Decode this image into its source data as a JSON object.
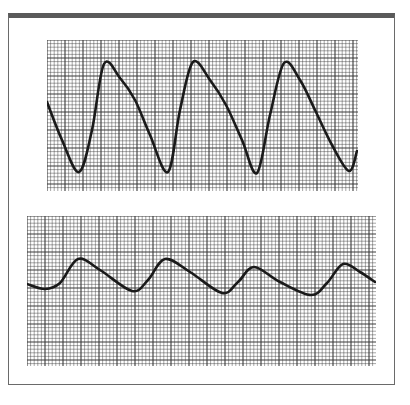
{
  "figure": {
    "grid": {
      "major_spacing_px": 18,
      "minor_per_major": 5,
      "line_color": "#3a3a3a",
      "trace_color": "#1a1a1a"
    }
  },
  "chart_data": [
    {
      "type": "line",
      "title": "",
      "panel": "top",
      "description": "Large-amplitude periodic waveform with sharp upstroke, rounded peak, shoulder and gradual downstroke",
      "x": [
        47,
        62,
        79,
        92,
        104,
        120,
        135,
        150,
        168,
        180,
        193,
        210,
        226,
        242,
        257,
        270,
        284,
        300,
        315,
        332,
        349,
        357
      ],
      "y": [
        102,
        140,
        172,
        130,
        64,
        78,
        100,
        135,
        172,
        110,
        62,
        80,
        105,
        140,
        173,
        115,
        63,
        80,
        110,
        145,
        171,
        151
      ],
      "xlim": [
        47,
        357
      ],
      "ylim": [
        40,
        190
      ],
      "peaks": 3,
      "troughs": 3
    },
    {
      "type": "line",
      "title": "",
      "panel": "bottom",
      "description": "Lower-amplitude periodic waveform with rounded peaks and gradual decline",
      "x": [
        27,
        45,
        60,
        78,
        100,
        132,
        148,
        165,
        190,
        222,
        238,
        254,
        280,
        311,
        327,
        343,
        360,
        375
      ],
      "y": [
        284,
        289,
        283,
        259,
        270,
        291,
        280,
        259,
        272,
        293,
        282,
        267,
        282,
        295,
        283,
        264,
        272,
        282
      ],
      "xlim": [
        27,
        375
      ],
      "ylim": [
        216,
        365
      ],
      "peaks": 4,
      "troughs": 4
    }
  ]
}
